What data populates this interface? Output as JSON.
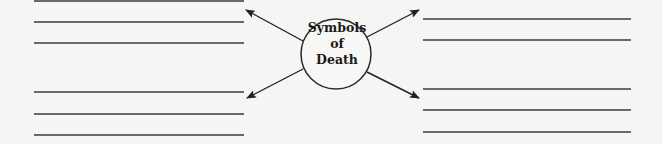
{
  "diagram": {
    "center": {
      "line1": "Symbols",
      "line2": "of",
      "line3": "Death"
    },
    "left_top_lines": [
      1,
      22,
      43
    ],
    "left_bottom_lines": [
      92,
      114,
      135
    ],
    "right_top_lines": [
      19,
      40
    ],
    "right_bottom_lines": [
      89,
      110,
      132
    ],
    "colors": {
      "ink": "#2a2a2a",
      "background": "#f5f5f3"
    }
  }
}
